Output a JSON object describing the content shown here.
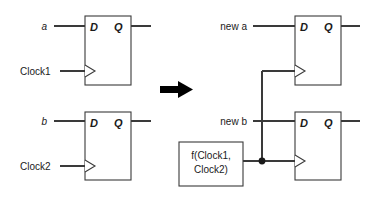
{
  "figure": {
    "type": "digital-circuit-diagram",
    "transform_arrow": "right-arrow"
  },
  "pins": {
    "d": "D",
    "q": "Q"
  },
  "left_circuit": {
    "flipflop_top": {
      "name": "flip-flop-1",
      "d_label": "D",
      "q_label": "Q",
      "data_input": "a",
      "clock_input": "Clock1"
    },
    "flipflop_bottom": {
      "name": "flip-flop-2",
      "d_label": "D",
      "q_label": "Q",
      "data_input": "b",
      "clock_input": "Clock2"
    }
  },
  "right_circuit": {
    "flipflop_top": {
      "name": "flip-flop-3",
      "d_label": "D",
      "q_label": "Q",
      "data_input": "new a"
    },
    "flipflop_bottom": {
      "name": "flip-flop-4",
      "d_label": "D",
      "q_label": "Q",
      "data_input": "new b"
    },
    "clock_function_box": {
      "name": "clock-function",
      "line1_italic": "f",
      "line1_rest": "(Clock1,",
      "line2": "Clock2)"
    }
  },
  "colors": {
    "wire": "#3a3a3a",
    "box_fill": "#ffffff",
    "text": "#1a1a1a",
    "arrow": "#000000",
    "background": "#ffffff"
  }
}
